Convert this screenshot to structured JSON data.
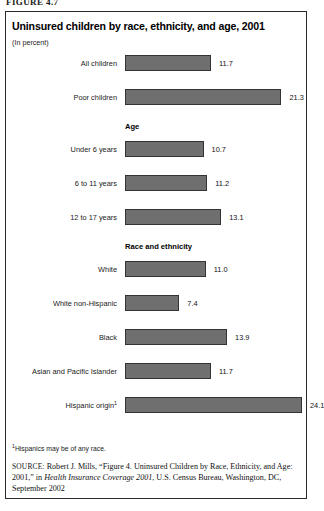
{
  "figure": {
    "number_label": "FIGURE 4.7",
    "title": "Uninsured children by race, ethnicity, and age, 2001",
    "subtitle": "(In percent)"
  },
  "footnote": {
    "marker": "1",
    "text": "Hispanics may be of any race."
  },
  "source": {
    "label": "SOURCE:",
    "part1": " Robert J. Mills, “Figure 4. Uninsured Children by Race, Ethnicity, and Age: 2001,” in ",
    "italic": "Health Insurance Coverage 2001",
    "part2": ", U.S. Census Bureau, Washington, DC, September 2002"
  },
  "colors": {
    "bar_fill": "#6f6f6f",
    "bar_border": "#333333",
    "frame": "#2b2b2b",
    "text": "#111111"
  },
  "chart_data": {
    "type": "bar",
    "orientation": "horizontal",
    "title": "Uninsured children by race, ethnicity, and age, 2001",
    "subtitle": "(In percent)",
    "xlabel": "",
    "ylabel": "",
    "xlim": [
      0,
      24.1
    ],
    "grid": false,
    "legend": false,
    "value_labels": true,
    "categories": [
      "All children",
      "Poor children",
      "Under 6 years",
      "6 to 11 years",
      "12 to 17 years",
      "White",
      "White non-Hispanic",
      "Black",
      "Asian and Pacific Islander",
      "Hispanic origin"
    ],
    "values": [
      11.7,
      21.3,
      10.7,
      11.2,
      13.1,
      11.0,
      7.4,
      13.9,
      11.7,
      24.1
    ],
    "group_headings": [
      "Age",
      "Race and ethnicity"
    ],
    "rows": [
      {
        "label": "All children",
        "value": 11.7,
        "value_label": "11.7",
        "group": null,
        "footnote": ""
      },
      {
        "label": "Poor children",
        "value": 21.3,
        "value_label": "21.3",
        "group": null,
        "footnote": ""
      },
      {
        "label": "Under 6 years",
        "value": 10.7,
        "value_label": "10.7",
        "group": "Age",
        "footnote": ""
      },
      {
        "label": "6 to 11 years",
        "value": 11.2,
        "value_label": "11.2",
        "group": "Age",
        "footnote": ""
      },
      {
        "label": "12 to 17 years",
        "value": 13.1,
        "value_label": "13.1",
        "group": "Age",
        "footnote": ""
      },
      {
        "label": "White",
        "value": 11.0,
        "value_label": "11.0",
        "group": "Race and ethnicity",
        "footnote": ""
      },
      {
        "label": "White non-Hispanic",
        "value": 7.4,
        "value_label": "7.4",
        "group": "Race and ethnicity",
        "footnote": ""
      },
      {
        "label": "Black",
        "value": 13.9,
        "value_label": "13.9",
        "group": "Race and ethnicity",
        "footnote": ""
      },
      {
        "label": "Asian and Pacific Islander",
        "value": 11.7,
        "value_label": "11.7",
        "group": "Race and ethnicity",
        "footnote": ""
      },
      {
        "label": "Hispanic origin",
        "value": 24.1,
        "value_label": "24.1",
        "group": "Race and ethnicity",
        "footnote": "1"
      }
    ]
  }
}
